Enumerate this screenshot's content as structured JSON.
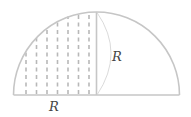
{
  "figure": {
    "labels": {
      "radius_vertical": "R",
      "radius_horizontal": "R"
    },
    "colors": {
      "outline": "#c6c6c6",
      "hatch": "#b8b8b8",
      "thin_arc": "#d0d0d0",
      "text": "#444444"
    },
    "geometry": {
      "center_x": 96.5,
      "baseline_y": 95,
      "radius": 83,
      "hatch_count": 7
    }
  }
}
